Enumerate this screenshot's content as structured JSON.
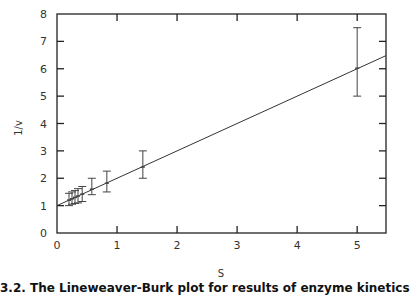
{
  "chart_data": {
    "type": "scatter",
    "title": "",
    "xlabel": "S",
    "ylabel": "1/v",
    "xlim": [
      0,
      5.48
    ],
    "ylim": [
      0,
      8
    ],
    "x_ticks": [
      0,
      1,
      2,
      3,
      4,
      5
    ],
    "y_ticks": [
      0,
      1,
      2,
      3,
      4,
      5,
      6,
      7,
      8
    ],
    "grid": false,
    "legend": null,
    "series": [
      {
        "name": "data",
        "points": [
          {
            "x": 0.2,
            "y": 1.2,
            "err_low": 1.0,
            "err_high": 1.45
          },
          {
            "x": 0.25,
            "y": 1.25,
            "err_low": 1.05,
            "err_high": 1.5
          },
          {
            "x": 0.3,
            "y": 1.3,
            "err_low": 1.08,
            "err_high": 1.55
          },
          {
            "x": 0.35,
            "y": 1.35,
            "err_low": 1.1,
            "err_high": 1.62
          },
          {
            "x": 0.42,
            "y": 1.42,
            "err_low": 1.15,
            "err_high": 1.7
          },
          {
            "x": 0.58,
            "y": 1.6,
            "err_low": 1.4,
            "err_high": 2.0
          },
          {
            "x": 0.83,
            "y": 1.82,
            "err_low": 1.5,
            "err_high": 2.26
          },
          {
            "x": 1.43,
            "y": 2.41,
            "err_low": 2.0,
            "err_high": 3.0
          },
          {
            "x": 5.0,
            "y": 6.02,
            "err_low": 5.0,
            "err_high": 7.5
          }
        ]
      },
      {
        "name": "linear fit",
        "type": "line",
        "intercept": 1.0,
        "slope": 1.0
      }
    ],
    "caption": "3.2. The Lineweaver-Burk plot for results of enzyme kinetics"
  },
  "axes": {
    "x_label": "S",
    "y_label": "1/v"
  },
  "caption": "3.2. The Lineweaver-Burk plot for results of enzyme kinetics",
  "colors": {
    "axis": "#222222",
    "line": "#333333",
    "errorbar": "#444444"
  }
}
